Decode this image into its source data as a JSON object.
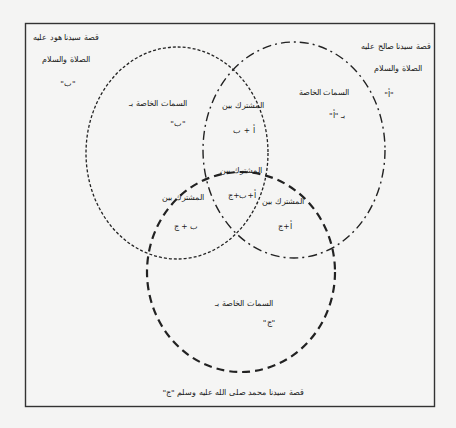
{
  "frame": {
    "stroke_color": "#333333"
  },
  "circles": {
    "hud": {
      "title_line1": "قصة سيدنا هود عليه",
      "title_line2": "الصلاة والسلام",
      "symbol": "\"ب\"",
      "unique_label": "السمات الخاصة بـ",
      "unique_symbol": "\"ب\"",
      "line_style": "fine-dashed"
    },
    "salih": {
      "title_line1": "قصة سيدنا صالح عليه",
      "title_line2": "الصلاة والسلام",
      "symbol": "\"أ\"",
      "unique_label": "السمات الخاصة",
      "unique_symbol": "بـ \"أ\"",
      "line_style": "dash-dot"
    },
    "muhammad": {
      "caption": "قصة سيدنا محمد صلى الله عليه وسلم \"ج\"",
      "unique_label": "السمات الخاصة بـ",
      "unique_symbol": "\"ج\"",
      "line_style": "heavy-dashed"
    }
  },
  "intersections": {
    "a_b": {
      "label": "المشترك بين",
      "value": "أ + ب"
    },
    "a_b_c": {
      "label": "المشترك بين",
      "value": "أ+ب+ج"
    },
    "b_c": {
      "label": "المشترك بين",
      "value": "ب + ج"
    },
    "a_c": {
      "label": "المشترك بين",
      "value": "أ+ج"
    }
  }
}
